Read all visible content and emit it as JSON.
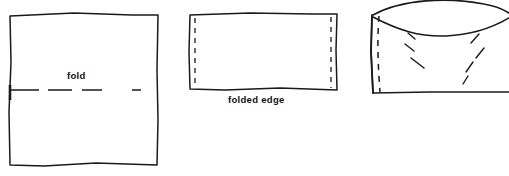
{
  "diagram": {
    "background_color": "#ffffff",
    "ink_color": "#1a1a1a",
    "labels": {
      "fold": "fold",
      "folded_edge": "folded edge"
    },
    "figures": [
      {
        "id": "figure-1-open-square",
        "name": "open fabric square with fold line",
        "label": "fold",
        "description": "large square of fabric drawn with freehand outline and a horizontal dashed fold line across the middle",
        "bounds": {
          "x": 8,
          "y": 14,
          "width": 151,
          "height": 152
        },
        "outline_path": "M 10,16 L 74,13 L 132,15 L 158,15 L 157,70 L 158,120 L 157,165 L 96,163 L 44,166 L 10,165 L 9,112 L 11,62 Z",
        "fold_line": {
          "y": 90,
          "x_start": 9,
          "x_end": 146,
          "style": "dashed",
          "dash_pattern": "28 9 22 9 18"
        },
        "fold_tick": {
          "x": 10,
          "y_start": 86,
          "y_end": 99
        }
      },
      {
        "id": "figure-2-folded-rect",
        "name": "folded fabric rectangle with folded edge",
        "label": "folded edge",
        "description": "fabric folded in half forming a wide rectangle, with vertical dashed stitch lines just inside the left and right edges",
        "bounds": {
          "x": 188,
          "y": 13,
          "width": 150,
          "height": 78
        },
        "outline_path": "M 190,15 L 250,13 L 312,14 L 337,14 L 336,50 L 337,90 L 280,88 L 225,90 L 190,89 L 189,52 Z",
        "dashed_guides": [
          {
            "x": 195,
            "y_start": 18,
            "y_end": 87,
            "style": "dashed"
          },
          {
            "x": 331,
            "y_start": 17,
            "y_end": 88,
            "style": "dashed"
          }
        ]
      },
      {
        "id": "figure-3-curled-flap",
        "name": "fabric with curled open top flap",
        "label": "",
        "description": "fabric piece with the top layer curling upward and away, dashed seam line at the left and short diagonal shading dashes inside",
        "bounds": {
          "x": 369,
          "y": 2,
          "width": 140,
          "height": 93
        },
        "outline_path": "M 372,17 L 380,14 L 388,14 L 372,16 L 371,50 L 372,93 L 430,92 L 509,92 L 509,16 L 430,18 Z",
        "curl_upper_path": "M 374,16 C 410,0 455,-2 490,6 C 500,8 506,12 509,14",
        "curl_lower_path": "M 374,17 C 400,30 420,36 445,35 C 475,34 496,24 509,18",
        "dashed_seam": {
          "x": 379,
          "y_start": 15,
          "y_end": 92,
          "style": "dashed"
        },
        "shading_dashes": [
          {
            "x1": 408,
            "y1": 33,
            "x2": 415,
            "y2": 39
          },
          {
            "x1": 405,
            "y1": 44,
            "x2": 414,
            "y2": 51
          },
          {
            "x1": 411,
            "y1": 58,
            "x2": 424,
            "y2": 68
          },
          {
            "x1": 479,
            "y1": 34,
            "x2": 471,
            "y2": 43
          },
          {
            "x1": 484,
            "y1": 48,
            "x2": 476,
            "y2": 58
          },
          {
            "x1": 473,
            "y1": 62,
            "x2": 466,
            "y2": 72
          },
          {
            "x1": 468,
            "y1": 76,
            "x2": 463,
            "y2": 84
          }
        ]
      }
    ]
  }
}
